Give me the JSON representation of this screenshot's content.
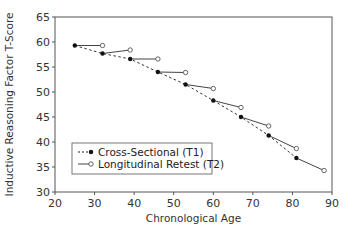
{
  "chart_data": {
    "type": "line",
    "title": "",
    "xlabel": "Chronological Age",
    "ylabel": "Inductive Reasoning Factor T-Score",
    "xlim": [
      20,
      90
    ],
    "ylim": [
      30,
      65
    ],
    "xticks": [
      20,
      30,
      40,
      50,
      60,
      70,
      80,
      90
    ],
    "yticks": [
      30,
      35,
      40,
      45,
      50,
      55,
      60,
      65
    ],
    "grid": false,
    "legend_position": "bottom-left",
    "series": [
      {
        "name": "Cross-Sectional (T1)",
        "style": "dashed line, filled circle markers",
        "color": "#222222",
        "points": [
          {
            "x": 25,
            "y": 59.3
          },
          {
            "x": 32,
            "y": 57.7
          },
          {
            "x": 39,
            "y": 56.6
          },
          {
            "x": 46,
            "y": 54.0
          },
          {
            "x": 53,
            "y": 51.5
          },
          {
            "x": 60,
            "y": 48.3
          },
          {
            "x": 67,
            "y": 45.0
          },
          {
            "x": 74,
            "y": 41.3
          },
          {
            "x": 81,
            "y": 36.8
          }
        ]
      },
      {
        "name": "Longitudinal Retest (T2)",
        "style": "solid segments from each T1 point to its 7-year retest, open circle markers",
        "color": "#444444",
        "segments": [
          {
            "from": {
              "x": 25,
              "y": 59.3
            },
            "to": {
              "x": 32,
              "y": 59.3
            }
          },
          {
            "from": {
              "x": 32,
              "y": 57.7
            },
            "to": {
              "x": 39,
              "y": 58.4
            }
          },
          {
            "from": {
              "x": 39,
              "y": 56.6
            },
            "to": {
              "x": 46,
              "y": 56.6
            }
          },
          {
            "from": {
              "x": 46,
              "y": 54.0
            },
            "to": {
              "x": 53,
              "y": 53.9
            }
          },
          {
            "from": {
              "x": 53,
              "y": 51.5
            },
            "to": {
              "x": 60,
              "y": 50.7
            }
          },
          {
            "from": {
              "x": 60,
              "y": 48.3
            },
            "to": {
              "x": 67,
              "y": 46.9
            }
          },
          {
            "from": {
              "x": 67,
              "y": 45.0
            },
            "to": {
              "x": 74,
              "y": 43.2
            }
          },
          {
            "from": {
              "x": 74,
              "y": 41.3
            },
            "to": {
              "x": 81,
              "y": 38.7
            }
          },
          {
            "from": {
              "x": 81,
              "y": 36.8
            },
            "to": {
              "x": 88,
              "y": 34.3
            }
          }
        ]
      }
    ]
  }
}
